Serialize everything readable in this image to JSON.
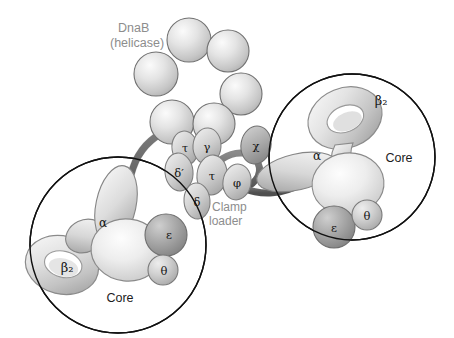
{
  "figure": {
    "background": "#ffffff",
    "outline_color": "#1a1a1a",
    "strand_color": "#6e6e6e",
    "strand_color_dark": "#5a5a5a"
  },
  "labels": {
    "dnab_line1": "DnaB",
    "dnab_line2": "(helicase)",
    "clamp_line1": "Clamp",
    "clamp_line2": "loader",
    "core_left": "Core",
    "core_right": "Core",
    "label_gray": "#8d8d8d",
    "label_dark": "#222222"
  },
  "clamp_loader": {
    "name": "Clamp loader",
    "subunits": [
      {
        "id": "tau-upper",
        "symbol": "τ",
        "name": "tau",
        "cx": 185,
        "cy": 148,
        "rx": 13,
        "ry": 17,
        "rot": -8,
        "fill": "#c9c9c9"
      },
      {
        "id": "gamma",
        "symbol": "γ",
        "name": "gamma",
        "cx": 207,
        "cy": 146,
        "rx": 14,
        "ry": 18,
        "rot": 4,
        "fill": "#cfcfcf"
      },
      {
        "id": "chi",
        "symbol": "χ",
        "name": "chi",
        "cx": 256,
        "cy": 145,
        "rx": 15,
        "ry": 19,
        "rot": 10,
        "fill": "#a9a9a9"
      },
      {
        "id": "delta-prime",
        "symbol": "δ′",
        "name": "delta prime",
        "cx": 179,
        "cy": 172,
        "rx": 14,
        "ry": 19,
        "rot": -6,
        "fill": "#c0c0c0"
      },
      {
        "id": "tau-lower",
        "symbol": "τ",
        "name": "tau",
        "cx": 212,
        "cy": 175,
        "rx": 15,
        "ry": 20,
        "rot": 6,
        "fill": "#c4c4c4"
      },
      {
        "id": "phi",
        "symbol": "φ",
        "name": "phi",
        "cx": 237,
        "cy": 182,
        "rx": 14,
        "ry": 18,
        "rot": 8,
        "fill": "#bdbdbd"
      },
      {
        "id": "delta",
        "symbol": "δ",
        "name": "delta",
        "cx": 197,
        "cy": 201,
        "rx": 13,
        "ry": 18,
        "rot": -4,
        "fill": "#b9b9b9"
      }
    ]
  },
  "dnab_helicase": {
    "name": "DnaB (helicase)",
    "subunit_count": 6,
    "fill": "#dcdcdc",
    "spheres": [
      {
        "id": "dnab-1",
        "cx": 189,
        "cy": 40,
        "r": 22
      },
      {
        "id": "dnab-2",
        "cx": 228,
        "cy": 51,
        "r": 21
      },
      {
        "id": "dnab-3",
        "cx": 241,
        "cy": 94,
        "r": 21
      },
      {
        "id": "dnab-4",
        "cx": 214,
        "cy": 124,
        "r": 21
      },
      {
        "id": "dnab-5",
        "cx": 172,
        "cy": 122,
        "r": 22
      },
      {
        "id": "dnab-6",
        "cx": 156,
        "cy": 74,
        "r": 22
      }
    ]
  },
  "cores": [
    {
      "id": "core-left",
      "label": "Core",
      "circle": {
        "cx": 118,
        "cy": 245,
        "r": 88
      },
      "label_pos": {
        "x": 118,
        "y": 298
      },
      "components": [
        {
          "id": "beta2-left",
          "symbol": "β₂",
          "name": "beta2 sliding clamp",
          "label_x": 67,
          "label_y": 269
        },
        {
          "id": "alpha-left",
          "symbol": "α",
          "name": "alpha polymerase",
          "label_x": 101,
          "label_y": 225
        },
        {
          "id": "epsilon-left",
          "symbol": "ε",
          "name": "epsilon proofreading",
          "label_x": 170,
          "label_y": 235
        },
        {
          "id": "theta-left",
          "symbol": "θ",
          "name": "theta",
          "label_x": 165,
          "label_y": 270
        }
      ]
    },
    {
      "id": "core-right",
      "label": "Core",
      "circle": {
        "cx": 352,
        "cy": 157,
        "r": 83
      },
      "label_pos": {
        "x": 398,
        "y": 162
      },
      "components": [
        {
          "id": "beta2-right",
          "symbol": "β₂",
          "name": "beta2 sliding clamp",
          "label_x": 381,
          "label_y": 103
        },
        {
          "id": "alpha-right",
          "symbol": "α",
          "name": "alpha polymerase",
          "label_x": 318,
          "label_y": 159
        },
        {
          "id": "epsilon-right",
          "symbol": "ε",
          "name": "epsilon proofreading",
          "label_x": 322,
          "label_y": 228
        },
        {
          "id": "theta-right",
          "symbol": "θ",
          "name": "theta",
          "label_x": 363,
          "label_y": 218
        }
      ]
    }
  ]
}
